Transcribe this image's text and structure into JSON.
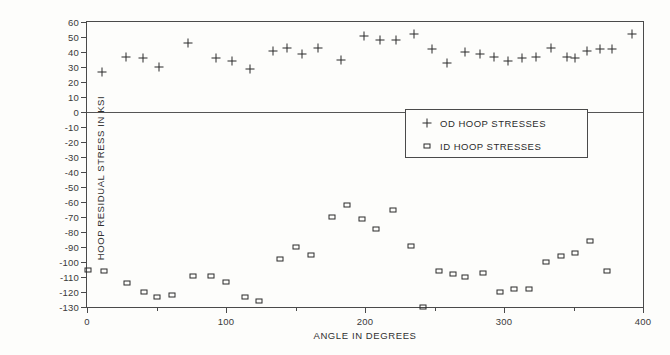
{
  "chart_data": {
    "type": "scatter",
    "title": "",
    "xlabel": "ANGLE IN DEGREES",
    "ylabel": "HOOP RESIDUAL STRESS IN KSI",
    "xlim": [
      0,
      400
    ],
    "ylim": [
      -130,
      60
    ],
    "grid": false,
    "zero_line": true,
    "legend_position": "center-right",
    "x_major_ticks": [
      0,
      100,
      200,
      300,
      400
    ],
    "x_minor_ticks": [
      50,
      150,
      250,
      350
    ],
    "x_tick_labels": [
      "0",
      "100",
      "200",
      "300",
      "400"
    ],
    "y_ticks": [
      -130,
      -120,
      -110,
      -100,
      -90,
      -80,
      -70,
      -60,
      -50,
      -40,
      -30,
      -20,
      -10,
      0,
      10,
      20,
      30,
      40,
      50,
      60
    ],
    "y_tick_labels": [
      "-130",
      "-120",
      "-110",
      "-100",
      "-90",
      "-80",
      "-70",
      "-60",
      "-50",
      "-40",
      "-30",
      "-20",
      "-10",
      "0",
      "10",
      "20",
      "30",
      "40",
      "50",
      "60"
    ],
    "series": [
      {
        "name": "OD HOOP STRESSES",
        "marker": "plus",
        "color": "#2b2b2b",
        "points": [
          [
            11,
            27
          ],
          [
            28,
            37
          ],
          [
            40,
            36
          ],
          [
            52,
            30
          ],
          [
            73,
            46
          ],
          [
            93,
            36
          ],
          [
            104,
            34
          ],
          [
            117,
            29
          ],
          [
            134,
            41
          ],
          [
            144,
            43
          ],
          [
            155,
            39
          ],
          [
            166,
            43
          ],
          [
            183,
            35
          ],
          [
            199,
            51
          ],
          [
            211,
            48
          ],
          [
            222,
            48
          ],
          [
            235,
            52
          ],
          [
            248,
            42
          ],
          [
            259,
            33
          ],
          [
            272,
            40
          ],
          [
            283,
            39
          ],
          [
            293,
            37
          ],
          [
            303,
            34
          ],
          [
            313,
            36
          ],
          [
            323,
            37
          ],
          [
            334,
            43
          ],
          [
            345,
            37
          ],
          [
            351,
            36
          ],
          [
            360,
            41
          ],
          [
            369,
            42
          ],
          [
            378,
            42
          ],
          [
            392,
            52
          ]
        ]
      },
      {
        "name": "ID HOOP STRESSES",
        "marker": "square",
        "color": "#2b2b2b",
        "points": [
          [
            1,
            -105
          ],
          [
            12,
            -106
          ],
          [
            29,
            -114
          ],
          [
            41,
            -120
          ],
          [
            50,
            -123
          ],
          [
            61,
            -122
          ],
          [
            76,
            -109
          ],
          [
            89,
            -109
          ],
          [
            100,
            -113
          ],
          [
            114,
            -123
          ],
          [
            124,
            -126
          ],
          [
            139,
            -98
          ],
          [
            150,
            -90
          ],
          [
            161,
            -95
          ],
          [
            176,
            -70
          ],
          [
            187,
            -62
          ],
          [
            198,
            -71
          ],
          [
            208,
            -78
          ],
          [
            220,
            -65
          ],
          [
            233,
            -89
          ],
          [
            242,
            -130
          ],
          [
            253,
            -106
          ],
          [
            263,
            -108
          ],
          [
            272,
            -110
          ],
          [
            285,
            -107
          ],
          [
            297,
            -120
          ],
          [
            307,
            -118
          ],
          [
            318,
            -118
          ],
          [
            330,
            -100
          ],
          [
            341,
            -96
          ],
          [
            351,
            -94
          ],
          [
            362,
            -86
          ],
          [
            374,
            -106
          ]
        ]
      }
    ]
  },
  "legend": {
    "entries": [
      {
        "symbol": "plus-marker",
        "label": "OD HOOP STRESSES"
      },
      {
        "symbol": "square-marker",
        "label": "ID HOOP STRESSES"
      }
    ]
  }
}
